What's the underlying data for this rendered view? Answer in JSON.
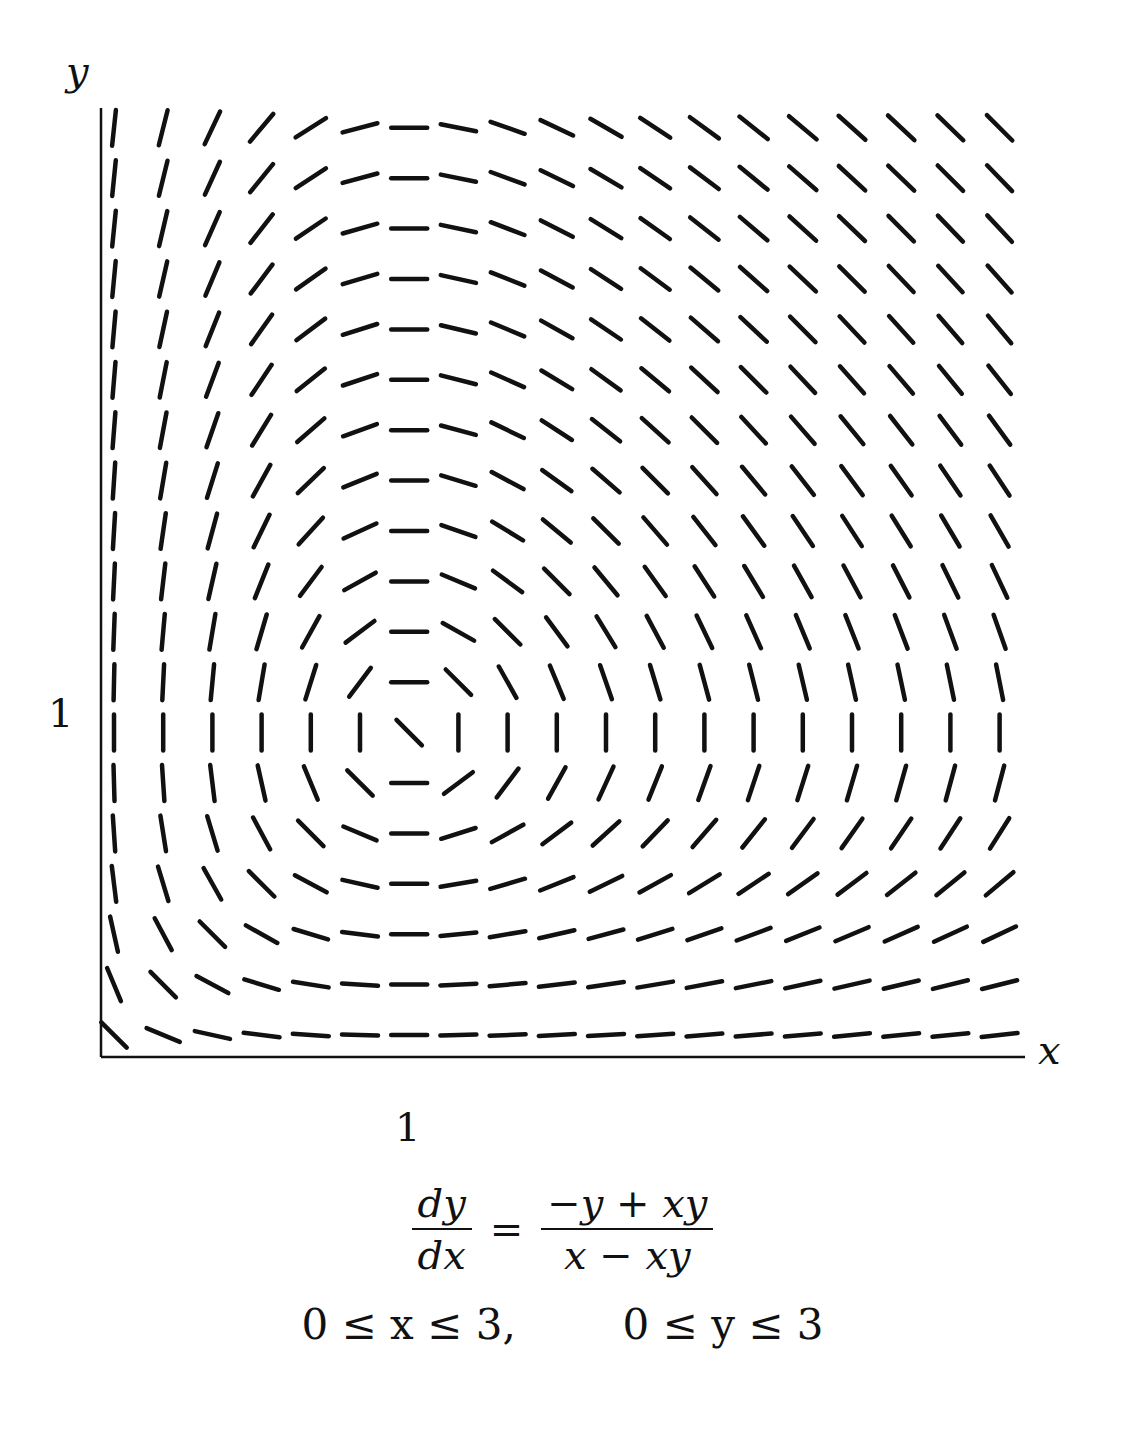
{
  "chart_data": {
    "type": "slope_field",
    "title": "",
    "equation": {
      "lhs_numerator": "dy",
      "lhs_denominator": "dx",
      "equals": "=",
      "rhs_numerator": "−y + xy",
      "rhs_denominator": "x − xy",
      "expression": "dy/dx = (-y + x*y) / (x - x*y)"
    },
    "domain_text": {
      "x_range": "0 ≤ x ≤ 3,",
      "y_range": "0 ≤ y ≤ 3"
    },
    "xlabel": "x",
    "ylabel": "y",
    "xlim": [
      0,
      3
    ],
    "ylim": [
      0,
      3
    ],
    "x_ticks": [
      {
        "value": 1,
        "label": "1"
      }
    ],
    "y_ticks": [
      {
        "value": 1,
        "label": "1"
      }
    ],
    "grid": false,
    "legend": null,
    "field_grid": {
      "columns": 19,
      "rows": 19,
      "x_step": 0.142857,
      "y_step": 0.142857,
      "x_start": 0.142857,
      "y_start": 0.142857,
      "singular_point": [
        1,
        1
      ],
      "segment_length_px": 36
    }
  },
  "plot": {
    "axis_color": "#111111",
    "segment_color": "#111111",
    "origin_px": [
      101,
      1057
    ],
    "x_axis_end_px": 1025,
    "y_axis_top_px": 108,
    "first_col_px": 114,
    "col_spacing_px": 49.2,
    "bottom_row_px": 1035,
    "row_spacing_px": 50.4
  },
  "labels": {
    "x_axis": "x",
    "y_axis": "y",
    "x_tick_1": "1",
    "y_tick_1": "1"
  }
}
